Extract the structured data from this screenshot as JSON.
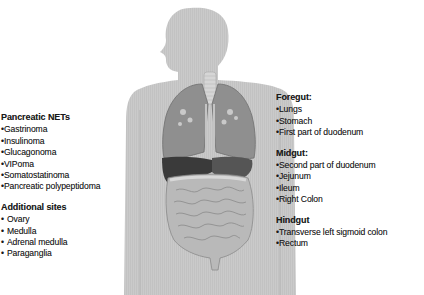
{
  "figure": {
    "colors": {
      "silhouette": "#c9c9c9",
      "silhouette_stripe": "#bdbdbd",
      "lungs": "#8f8f8f",
      "lung_outline": "#6f6f6f",
      "trachea": "#d8d8d8",
      "liver": "#3a3a3a",
      "stomach": "#555555",
      "intestines": "#b8b8b8",
      "intestine_lines": "#8a8a8a"
    }
  },
  "left": {
    "groups": [
      {
        "heading": "Pancreatic NETs",
        "bullet": "•",
        "items": [
          "Gastrinoma",
          "Insulinoma",
          "Glucagonoma",
          "VIPoma",
          "Somatostatinoma",
          "Pancreatic polypeptidoma"
        ]
      },
      {
        "heading": "Additional sites",
        "bullet": "•",
        "items": [
          "Ovary",
          "Medulla",
          "Adrenal medulla",
          "Paraganglia"
        ]
      }
    ]
  },
  "right": {
    "groups": [
      {
        "heading": "Foregut:",
        "bullet": "•",
        "items": [
          "Lungs",
          "Stomach",
          "First part of duodenum"
        ]
      },
      {
        "heading": "Midgut:",
        "bullet": "•",
        "items": [
          "Second part of duodenum",
          "Jejunum",
          "Ileum",
          "Right Colon"
        ]
      },
      {
        "heading": "Hindgut",
        "bullet": "•",
        "items": [
          "Transverse left sigmoid colon",
          "Rectum"
        ]
      }
    ]
  }
}
